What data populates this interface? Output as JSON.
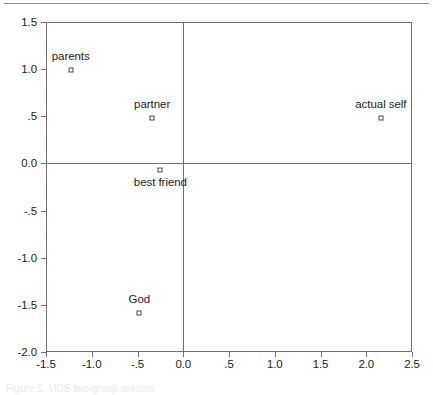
{
  "figure": {
    "caption": "Figure 1. MDS two-group solution"
  },
  "chart_data": {
    "type": "scatter",
    "title": "",
    "xlabel": "",
    "ylabel": "",
    "xlim": [
      -1.5,
      2.5
    ],
    "ylim": [
      -2.0,
      1.5
    ],
    "xticks": [
      -1.5,
      -1.0,
      -0.5,
      0.0,
      0.5,
      1.0,
      1.5,
      2.0,
      2.5
    ],
    "xtick_labels": [
      "-1.5",
      "-1.0",
      "-.5",
      "0.0",
      ".5",
      "1.0",
      "1.5",
      "2.0",
      "2.5"
    ],
    "yticks": [
      1.5,
      1.0,
      0.5,
      0.0,
      -0.5,
      -1.0,
      -1.5,
      -2.0
    ],
    "ytick_labels": [
      "1.5",
      "1.0",
      ".5",
      "0.0",
      "-.5",
      "-1.0",
      "-1.5",
      "-2.0"
    ],
    "grid": false,
    "legend": "none",
    "reference_lines": {
      "vertical_x": 0.0,
      "horizontal_y": 0.0
    },
    "marker_style": "open-square",
    "points": [
      {
        "label": "parents",
        "x": -1.23,
        "y": 0.99,
        "label_position": "above"
      },
      {
        "label": "partner",
        "x": -0.34,
        "y": 0.48,
        "label_position": "above"
      },
      {
        "label": "best friend",
        "x": -0.25,
        "y": -0.07,
        "label_position": "below"
      },
      {
        "label": "God",
        "x": -0.48,
        "y": -1.59,
        "label_position": "above"
      },
      {
        "label": "actual self",
        "x": 2.16,
        "y": 0.48,
        "label_position": "above"
      }
    ]
  },
  "colors": {
    "axis": "#6f6f6f",
    "marker_stroke": "#4a4a4a",
    "text": "#1c1c1c",
    "background": "#ffffff"
  }
}
